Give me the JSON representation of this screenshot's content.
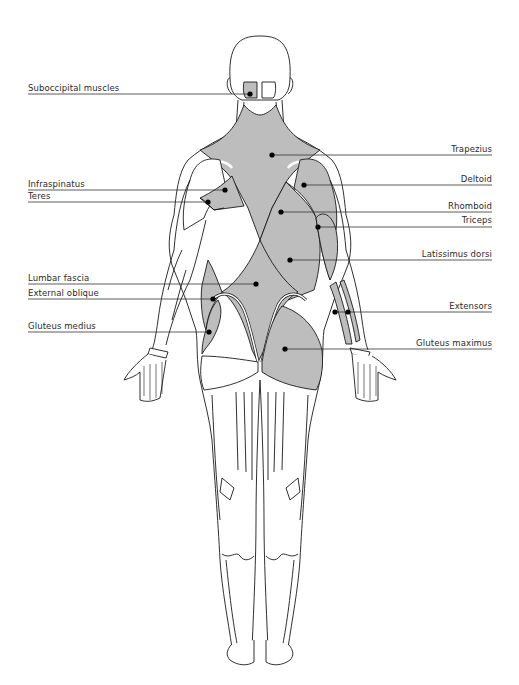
{
  "diagram": {
    "colors": {
      "muscle_fill": "#bdbdbd",
      "muscle_dark_fill": "#ababab",
      "outline": "#1a1a1a",
      "leader_line": "#333333",
      "dot": "#000000",
      "background": "#ffffff"
    },
    "labels_left": [
      {
        "id": "suboccipital",
        "text": "Suboccipital muscles",
        "x": 28,
        "y": 88,
        "dot": [
          250,
          94
        ]
      },
      {
        "id": "infraspinatus",
        "text": "Infraspinatus",
        "x": 28,
        "y": 186,
        "dot": [
          225,
          190
        ]
      },
      {
        "id": "teres",
        "text": "Teres",
        "x": 28,
        "y": 198,
        "dot": [
          208,
          202
        ]
      },
      {
        "id": "lumbar-fascia",
        "text": "Lumbar fascia",
        "x": 28,
        "y": 279,
        "dot": [
          256,
          284
        ]
      },
      {
        "id": "external-oblique",
        "text": "External oblique",
        "x": 28,
        "y": 294,
        "dot": [
          213,
          299
        ]
      },
      {
        "id": "gluteus-medius",
        "text": "Gluteus medius",
        "x": 28,
        "y": 327,
        "dot": [
          209,
          332
        ]
      }
    ],
    "labels_right": [
      {
        "id": "trapezius",
        "text": "Trapezius",
        "x": 492,
        "y": 150,
        "dot": [
          272,
          155
        ]
      },
      {
        "id": "deltoid",
        "text": "Deltoid",
        "x": 492,
        "y": 181,
        "dot": [
          304,
          185
        ]
      },
      {
        "id": "rhomboid",
        "text": "Rhomboid",
        "x": 492,
        "y": 208,
        "dot": [
          281,
          212
        ]
      },
      {
        "id": "triceps",
        "text": "Triceps",
        "x": 492,
        "y": 222,
        "dot": [
          318,
          227
        ]
      },
      {
        "id": "latissimus-dorsi",
        "text": "Latissimus dorsi",
        "x": 492,
        "y": 254,
        "dot": [
          290,
          260
        ]
      },
      {
        "id": "extensors",
        "text": "Extensors",
        "x": 492,
        "y": 306,
        "dot": [
          335,
          312
        ],
        "dot2": [
          348,
          312
        ]
      },
      {
        "id": "gluteus-maximus",
        "text": "Gluteus maximus",
        "x": 492,
        "y": 344,
        "dot": [
          285,
          349
        ]
      }
    ]
  }
}
